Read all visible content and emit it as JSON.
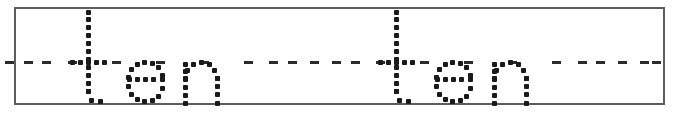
{
  "worksheet": {
    "type": "handwriting-tracing-practice",
    "traced_text": "ten ten",
    "word": "ten",
    "repetitions": 2,
    "script_style": "dotted-outline-lowercase-print",
    "guide_line_style": "dashed",
    "frame_border_color": "#5d5d5d",
    "dot_color": "#1a1a1a",
    "guide_color": "#2b2b2b",
    "background_color": "#ffffff",
    "accessible_label": "Handwriting practice row: trace the dotted word ten, repeated two times"
  },
  "words": [
    {
      "text": "ten",
      "index": 1,
      "letters": [
        {
          "char": "t",
          "x": 74
        },
        {
          "char": "e",
          "x": 128
        },
        {
          "char": "n",
          "x": 183
        }
      ]
    },
    {
      "text": "ten",
      "index": 2,
      "letters": [
        {
          "char": "t",
          "x": 382
        },
        {
          "char": "e",
          "x": 436
        },
        {
          "char": "n",
          "x": 492
        }
      ]
    }
  ],
  "guide_dashes": [
    {
      "x": 42
    },
    {
      "x": 269
    },
    {
      "x": 310
    },
    {
      "x": 351
    },
    {
      "x": 578
    },
    {
      "x": 618
    },
    {
      "x": 652
    }
  ],
  "metrics": {
    "ascender_top_y": 12,
    "midline_y": 62,
    "baseline_y": 103,
    "x_height": 41,
    "dot_size_px": 5,
    "dot_spacing_px": 8
  }
}
